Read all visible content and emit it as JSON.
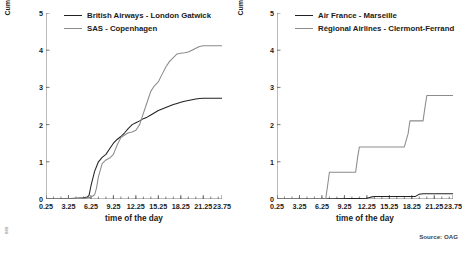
{
  "source_note": "Source: OAG",
  "corner_mark": "ees",
  "panels": [
    {
      "id": "left",
      "ylabel": "Cumulative sum of weighted indirect connections (x 1,000)",
      "xlabel": "time of the day",
      "legend": [
        {
          "label": "British Airways - London Gatwick",
          "color": "#222222"
        },
        {
          "label": "SAS - Copenhagen",
          "color": "#8b8b8b"
        }
      ]
    },
    {
      "id": "right",
      "ylabel": "Cumulative sum of weighted indirect connections (x 1,000)",
      "xlabel": "time of the day",
      "legend": [
        {
          "label": "Air France - Marseille",
          "color": "#222222"
        },
        {
          "label": "Régional Airlines - Clermont-Ferrand",
          "color": "#8b8b8b"
        }
      ]
    }
  ],
  "chart_data": [
    {
      "type": "line",
      "id": "left-chart",
      "title": "",
      "xlabel": "time of the day",
      "ylabel": "Cumulative sum of weighted indirect connections (x 1,000)",
      "xlim": [
        0.25,
        23.75
      ],
      "ylim": [
        0,
        5
      ],
      "yticks": [
        0,
        1,
        2,
        3,
        4,
        5
      ],
      "xticks": [
        0.25,
        3.25,
        6.25,
        9.25,
        12.25,
        15.25,
        18.25,
        21.25,
        23.75
      ],
      "grid": false,
      "legend_position": "top-left",
      "series": [
        {
          "name": "British Airways - London Gatwick",
          "color": "#222222",
          "x": [
            0.25,
            2.25,
            4.25,
            5.25,
            5.75,
            6.0,
            6.25,
            6.75,
            7.25,
            7.75,
            8.25,
            8.75,
            9.25,
            9.75,
            10.25,
            10.75,
            11.25,
            11.75,
            12.25,
            12.75,
            13.25,
            13.75,
            14.25,
            14.75,
            15.25,
            15.75,
            16.25,
            16.75,
            17.25,
            17.75,
            18.25,
            18.75,
            19.25,
            19.75,
            20.25,
            20.75,
            21.25,
            21.75,
            22.25,
            22.75,
            23.25,
            23.75
          ],
          "y": [
            0.0,
            0.0,
            0.02,
            0.03,
            0.05,
            0.1,
            0.35,
            0.75,
            1.0,
            1.12,
            1.2,
            1.35,
            1.5,
            1.6,
            1.68,
            1.78,
            1.9,
            2.0,
            2.05,
            2.1,
            2.16,
            2.2,
            2.26,
            2.32,
            2.38,
            2.42,
            2.46,
            2.5,
            2.54,
            2.57,
            2.6,
            2.63,
            2.65,
            2.67,
            2.69,
            2.7,
            2.71,
            2.71,
            2.71,
            2.71,
            2.71,
            2.71
          ]
        },
        {
          "name": "SAS - Copenhagen",
          "color": "#8b8b8b",
          "x": [
            0.25,
            2.25,
            4.25,
            5.25,
            5.75,
            6.25,
            6.5,
            6.75,
            7.0,
            7.25,
            7.75,
            8.25,
            8.75,
            9.25,
            9.75,
            10.25,
            10.75,
            11.25,
            11.75,
            12.25,
            12.75,
            13.25,
            13.75,
            14.25,
            14.75,
            15.25,
            15.75,
            16.25,
            16.75,
            17.25,
            17.75,
            18.25,
            18.75,
            19.25,
            19.75,
            20.25,
            20.75,
            21.25,
            21.75,
            22.25,
            22.75,
            23.25,
            23.75
          ],
          "y": [
            0.0,
            0.0,
            0.01,
            0.02,
            0.03,
            0.05,
            0.08,
            0.12,
            0.3,
            0.6,
            0.95,
            1.05,
            1.1,
            1.2,
            1.45,
            1.65,
            1.72,
            1.78,
            1.8,
            1.85,
            2.0,
            2.3,
            2.6,
            2.9,
            3.05,
            3.15,
            3.35,
            3.55,
            3.7,
            3.8,
            3.9,
            3.92,
            3.93,
            3.95,
            4.0,
            4.05,
            4.1,
            4.12,
            4.12,
            4.12,
            4.12,
            4.12,
            4.12
          ]
        }
      ]
    },
    {
      "type": "line",
      "id": "right-chart",
      "title": "",
      "xlabel": "time of the day",
      "ylabel": "Cumulative sum of weighted indirect connections (x 1,000)",
      "xlim": [
        0.25,
        23.75
      ],
      "ylim": [
        0,
        5
      ],
      "yticks": [
        0,
        1,
        2,
        3,
        4,
        5
      ],
      "xticks": [
        0.25,
        3.25,
        6.25,
        9.25,
        12.25,
        15.25,
        18.25,
        21.25,
        23.75
      ],
      "grid": false,
      "legend_position": "top-left",
      "series": [
        {
          "name": "Air France - Marseille",
          "color": "#222222",
          "x": [
            0.25,
            6.25,
            10.25,
            12.25,
            12.75,
            13.25,
            17.25,
            18.75,
            19.25,
            19.75,
            23.75
          ],
          "y": [
            0.0,
            0.0,
            0.01,
            0.02,
            0.05,
            0.07,
            0.07,
            0.07,
            0.13,
            0.14,
            0.14
          ]
        },
        {
          "name": "Régional Airlines - Clermont-Ferrand",
          "color": "#8b8b8b",
          "x": [
            0.25,
            6.75,
            7.0,
            7.25,
            10.75,
            11.0,
            11.25,
            17.25,
            17.75,
            18.0,
            19.75,
            20.0,
            20.25,
            23.75
          ],
          "y": [
            0.0,
            0.0,
            0.35,
            0.72,
            0.72,
            1.1,
            1.4,
            1.4,
            1.75,
            2.1,
            2.1,
            2.45,
            2.78,
            2.78
          ]
        }
      ]
    }
  ]
}
